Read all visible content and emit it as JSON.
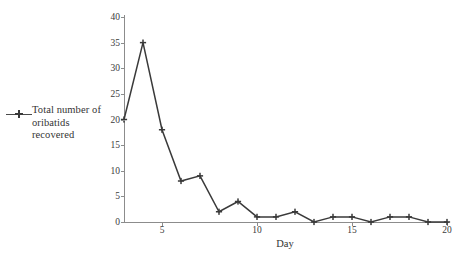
{
  "chart_data": {
    "type": "line",
    "title": "",
    "xlabel": "Day",
    "ylabel": "",
    "xlim": [
      3,
      20
    ],
    "ylim": [
      0,
      40
    ],
    "grid": false,
    "legend_position": "left",
    "x_ticks": [
      5,
      10,
      15,
      20
    ],
    "y_ticks": [
      0,
      5,
      10,
      15,
      20,
      25,
      30,
      35,
      40
    ],
    "series": [
      {
        "name": "Total number of oribatids recovered",
        "marker": "plus",
        "color": "#3a3a3a",
        "x": [
          3,
          4,
          5,
          6,
          7,
          8,
          9,
          10,
          11,
          12,
          13,
          14,
          15,
          16,
          17,
          18,
          19,
          20
        ],
        "values": [
          20,
          35,
          18,
          8,
          9,
          2,
          4,
          1,
          1,
          2,
          0,
          1,
          1,
          0,
          1,
          1,
          0,
          0
        ]
      }
    ]
  },
  "legend": {
    "entry_label": "Total number of oribatids recovered"
  },
  "axes": {
    "x_label": "Day",
    "x_tick_labels": [
      "5",
      "10",
      "15",
      "20"
    ],
    "y_tick_labels": [
      "0",
      "5",
      "10",
      "15",
      "20",
      "25",
      "30",
      "35",
      "40"
    ]
  },
  "colors": {
    "series": "#3a3a3a",
    "axis": "#8c8c8c",
    "text": "#333333",
    "background": "#ffffff"
  }
}
